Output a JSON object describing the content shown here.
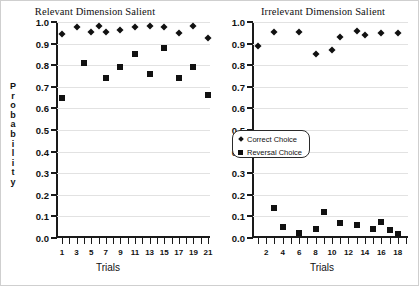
{
  "chart_data": {
    "type": "scatter",
    "ylabel": "Probability",
    "ylim": [
      0.0,
      1.0
    ],
    "yticks": [
      "0.0",
      "0.1",
      "0.2",
      "0.3",
      "0.4",
      "0.5",
      "0.6",
      "0.7",
      "0.8",
      "0.9",
      "1.0"
    ],
    "grid": true,
    "legend_position": "center",
    "legend": [
      {
        "label": "Correct Choice",
        "marker": "diamond"
      },
      {
        "label": "Reversal Choice",
        "marker": "square"
      }
    ],
    "panels": [
      {
        "name": "relevant",
        "title": "Relevant Dimension Salient",
        "xlabel": "Trials",
        "xlim": [
          1,
          21
        ],
        "xticks": [
          1,
          2,
          3,
          4,
          5,
          6,
          7,
          8,
          9,
          10,
          11,
          12,
          13,
          14,
          15,
          16,
          17,
          18,
          19,
          20,
          21
        ],
        "xticklabels": [
          "1",
          "",
          "3",
          "",
          "5",
          "",
          "7",
          "",
          "9",
          "",
          "11",
          "",
          "13",
          "",
          "15",
          "",
          "17",
          "",
          "19",
          "",
          "21"
        ],
        "series": [
          {
            "name": "Correct Choice",
            "marker": "diamond",
            "x": [
              1,
              3,
              5,
              6,
              7,
              9,
              11,
              13,
              15,
              17,
              19,
              21
            ],
            "y": [
              0.945,
              0.975,
              0.955,
              0.98,
              0.955,
              0.965,
              0.975,
              0.98,
              0.975,
              0.95,
              0.98,
              0.925
            ]
          },
          {
            "name": "Reversal Choice",
            "marker": "square",
            "x": [
              1,
              4,
              7,
              9,
              11,
              13,
              15,
              17,
              19,
              21
            ],
            "y": [
              0.65,
              0.81,
              0.74,
              0.79,
              0.85,
              0.76,
              0.88,
              0.74,
              0.79,
              0.66
            ]
          }
        ]
      },
      {
        "name": "irrelevant",
        "title": "Irrelevant Dimension Salient",
        "xlabel": "Trials",
        "xlim": [
          1,
          19
        ],
        "xticks": [
          1,
          2,
          3,
          4,
          5,
          6,
          7,
          8,
          9,
          10,
          11,
          12,
          13,
          14,
          15,
          16,
          17,
          18,
          19
        ],
        "xticklabels": [
          "",
          "2",
          "",
          "4",
          "",
          "6",
          "",
          "8",
          "",
          "10",
          "",
          "12",
          "",
          "14",
          "",
          "16",
          "",
          "18",
          ""
        ],
        "series": [
          {
            "name": "Correct Choice",
            "marker": "diamond",
            "x": [
              1,
              3,
              6,
              8,
              10,
              11,
              13,
              14,
              16,
              18
            ],
            "y": [
              0.89,
              0.955,
              0.955,
              0.85,
              0.87,
              0.93,
              0.96,
              0.94,
              0.95,
              0.95
            ]
          },
          {
            "name": "Reversal Choice",
            "marker": "square",
            "x": [
              3,
              4,
              6,
              8,
              9,
              11,
              13,
              15,
              16,
              17,
              18
            ],
            "y": [
              0.14,
              0.05,
              0.025,
              0.04,
              0.12,
              0.07,
              0.06,
              0.04,
              0.075,
              0.035,
              0.02
            ]
          }
        ]
      }
    ]
  },
  "yaxis_title_letters": [
    "P",
    "r",
    "o",
    "b",
    "a",
    "b",
    "i",
    "l",
    "i",
    "t",
    "y"
  ]
}
